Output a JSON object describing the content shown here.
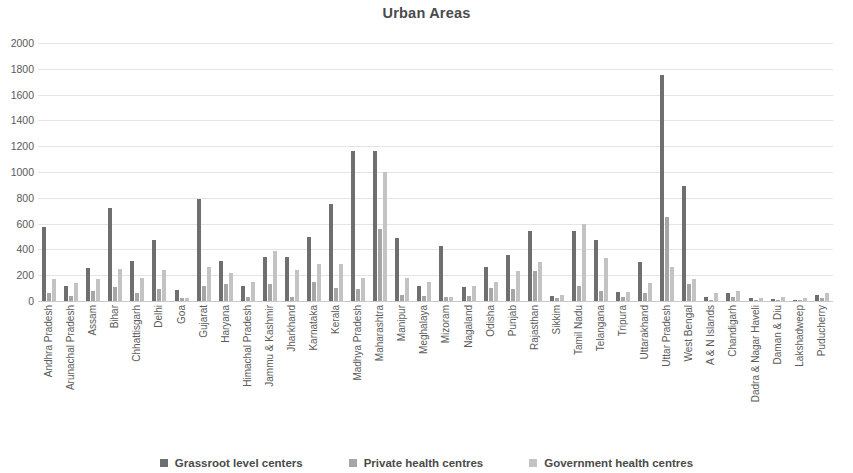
{
  "chart_data": {
    "type": "bar",
    "title": "Urban Areas",
    "xlabel": "",
    "ylabel": "",
    "ylim": [
      0,
      2000
    ],
    "ytick_step": 200,
    "yticks": [
      2000,
      1800,
      1600,
      1400,
      1200,
      1000,
      800,
      600,
      400,
      200,
      0
    ],
    "grid": true,
    "legend_position": "bottom",
    "colors": {
      "grassroot": "#6f6f6f",
      "private": "#a6a6a6",
      "government": "#c3c3c3",
      "gridline": "#e4e4e4",
      "text": "#595959"
    },
    "categories": [
      "Andhra Pradesh",
      "Arunachal Pradesh",
      "Assam",
      "Bihar",
      "Chhattisgarh",
      "Delhi",
      "Goa",
      "Gujarat",
      "Haryana",
      "Himachal Pradesh",
      "Jammu & Kashmir",
      "Jharkhand",
      "Karnataka",
      "Kerala",
      "Madhya Pradesh",
      "Maharashtra",
      "Manipur",
      "Meghalaya",
      "Mizoram",
      "Nagaland",
      "Odisha",
      "Punjab",
      "Rajasthan",
      "Sikkim",
      "Tamil Nadu",
      "Telangana",
      "Tripura",
      "Uttarakhand",
      "Uttar Pradesh",
      "West Bengal",
      "A & N Islands",
      "Chandigarh",
      "Dadra & Nagar Haveli",
      "Daman & Diu",
      "Lakshadweep",
      "Puducherry"
    ],
    "series": [
      {
        "name": "Grassroot level centers",
        "values": [
          570,
          120,
          255,
          720,
          310,
          470,
          85,
          790,
          310,
          120,
          340,
          340,
          500,
          750,
          1160,
          1160,
          490,
          120,
          430,
          110,
          260,
          360,
          540,
          40,
          540,
          470,
          70,
          300,
          1750,
          890,
          30,
          60,
          20,
          15,
          10,
          45
        ]
      },
      {
        "name": "Private health centres",
        "values": [
          60,
          40,
          80,
          110,
          60,
          95,
          20,
          120,
          130,
          30,
          130,
          30,
          150,
          100,
          90,
          560,
          50,
          40,
          30,
          40,
          100,
          90,
          230,
          20,
          120,
          80,
          30,
          60,
          650,
          130,
          10,
          30,
          10,
          10,
          5,
          25
        ]
      },
      {
        "name": "Government health centres",
        "values": [
          170,
          140,
          170,
          250,
          175,
          240,
          25,
          260,
          215,
          145,
          390,
          240,
          290,
          290,
          180,
          1000,
          175,
          150,
          30,
          120,
          150,
          230,
          300,
          45,
          600,
          330,
          70,
          140,
          260,
          170,
          60,
          75,
          20,
          30,
          25,
          60
        ]
      }
    ]
  },
  "legend": {
    "items": [
      {
        "label": "Grassroot level centers",
        "series_index": 0
      },
      {
        "label": "Private health centres",
        "series_index": 1
      },
      {
        "label": "Government health centres",
        "series_index": 2
      }
    ]
  }
}
